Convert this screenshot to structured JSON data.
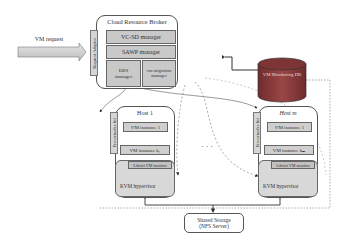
{
  "diagram": {
    "request": {
      "label": "VM request"
    },
    "broker": {
      "title": "Cloud Resource Broker",
      "adaptor": "Request Adaptor",
      "managers": [
        {
          "label": "VC-SD manager"
        },
        {
          "label": "SAWP manager"
        },
        {
          "label": "DRS manager"
        },
        {
          "label": "vm migration manager"
        }
      ]
    },
    "database": {
      "label": "VM Monitoring DB",
      "color": "#8b3a3a"
    },
    "hosts": [
      {
        "title": "Host 1",
        "proc_interface": "Procernodes Inf",
        "vm_first": "VM instance 1",
        "vm_last": "VM instance k₁",
        "libvirt": "Libvirt VM monitor",
        "hypervisor": "KVM hypervisor"
      },
      {
        "title": "Host m",
        "proc_interface": "Procernodes Inf",
        "vm_first": "VM instance 1",
        "vm_last": "VM instance kₘ",
        "libvirt": "Libvirt VM monitor",
        "hypervisor": "KVM hypervisor"
      }
    ],
    "ellipsis": "· · ·",
    "storage": {
      "line1": "Shared Storage",
      "line2": "(NFS Server)"
    }
  }
}
